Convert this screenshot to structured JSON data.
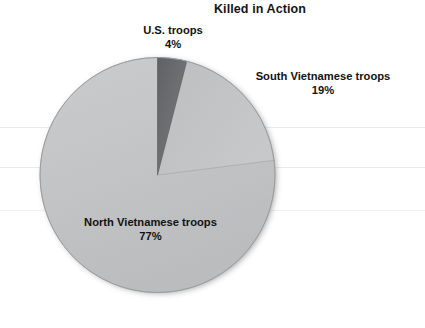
{
  "chart_data": {
    "type": "pie",
    "title": "Killed in Action",
    "xlabel": "",
    "ylabel": "",
    "legend_position": "none",
    "grid": false,
    "labels": [
      "U.S. troops",
      "South Vietnamese troops",
      "North Vietnamese troops"
    ],
    "values": [
      4,
      19,
      77
    ],
    "value_labels": [
      "4%",
      "19%",
      "77%"
    ],
    "units": "percent",
    "slice_colors": [
      "#6f7173",
      "#b9bbbd",
      "#c3c5c6"
    ],
    "start_angle_deg": 0,
    "direction": "clockwise",
    "slices": [
      {
        "label": "U.S. troops",
        "value": 4,
        "value_label": "4%",
        "color": "#6f7173"
      },
      {
        "label": "South Vietnamese troops",
        "value": 19,
        "value_label": "19%",
        "color": "#b9bbbd"
      },
      {
        "label": "North Vietnamese troops",
        "value": 77,
        "value_label": "77%",
        "color": "#c3c5c6"
      }
    ]
  },
  "chart": {
    "title": "Killed in Action",
    "background_color": "#ffffff",
    "shadow_color": "#8e9092",
    "outline_color": "#9a9c9e",
    "label_color": "#121212"
  },
  "labels": {
    "us": {
      "name": "U.S. troops",
      "percent": "4%"
    },
    "south": {
      "name": "South Vietnamese troops",
      "percent": "19%"
    },
    "north": {
      "name": "North Vietnamese troops",
      "percent": "77%"
    }
  }
}
